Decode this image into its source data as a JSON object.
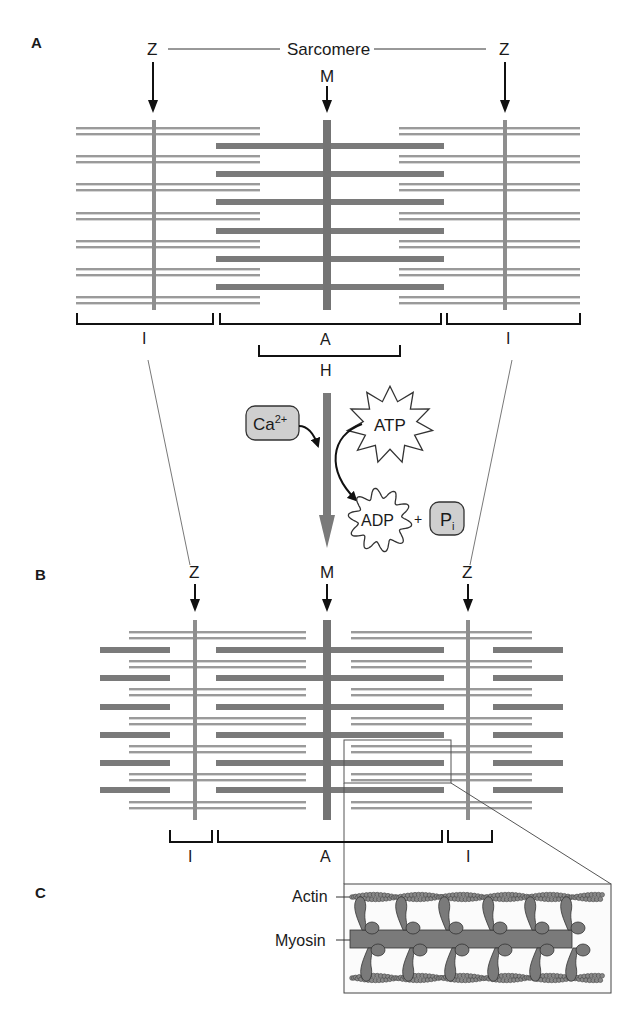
{
  "panels": {
    "a": {
      "label": "A",
      "sarcomere_label": "Sarcomere",
      "z_left": "Z",
      "z_right": "Z",
      "m_label": "M",
      "band_i_left": "I",
      "band_a": "A",
      "band_i_right": "I",
      "band_h": "H"
    },
    "transition": {
      "calcium": "Ca",
      "calcium_sup": "2+",
      "atp": "ATP",
      "adp": "ADP",
      "plus": "+",
      "pi": "P",
      "pi_sub": "i"
    },
    "b": {
      "label": "B",
      "z_left": "Z",
      "m_label": "M",
      "z_right": "Z",
      "band_i_left": "I",
      "band_a": "A",
      "band_i_right": "I"
    },
    "c": {
      "label": "C",
      "actin_label": "Actin",
      "myosin_label": "Myosin"
    }
  },
  "colors": {
    "thick_filament": "#7a7a7a",
    "thin_filament": "#9a9a9a",
    "m_line": "#747474",
    "z_line": "#8e8e8e",
    "box_fill": "#cfcfcf",
    "text": "#1a1a1a"
  }
}
